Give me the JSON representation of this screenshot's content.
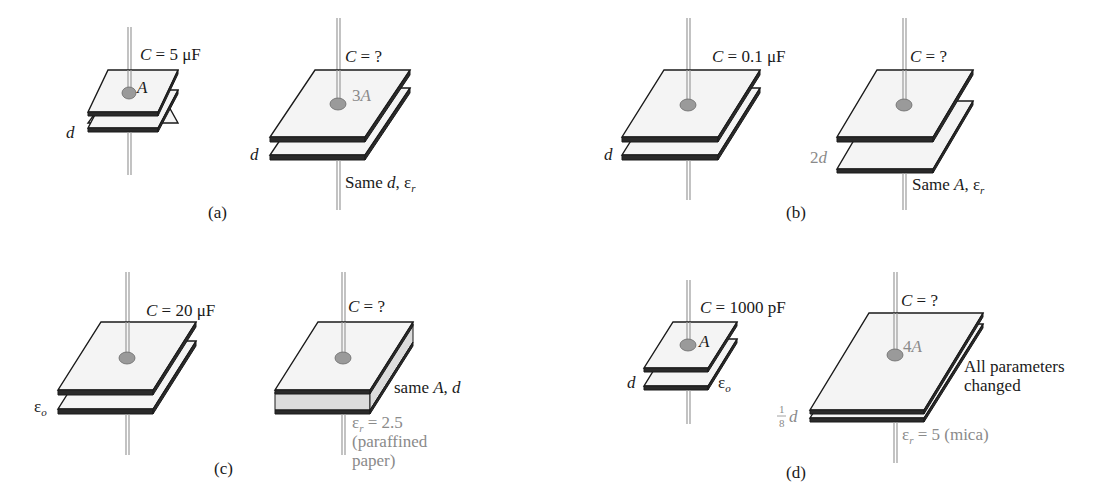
{
  "figure": {
    "panels": [
      {
        "id": "a",
        "caption": "(a)",
        "left": {
          "capacitance": "C = 5 μF",
          "C": "C",
          "eq": " = 5 ",
          "unit": "μF",
          "area_label": "A",
          "sep_label": "d"
        },
        "right": {
          "capacitance": "C = ?",
          "C": "C",
          "eq": " = ?",
          "area_label": "3A",
          "area_num": "3",
          "area_sym": "A",
          "sep_label": "d",
          "note": "Same d, ε_r",
          "note_pre": "Same ",
          "note_d": "d",
          "note_comma": ", ",
          "note_eps": "ε",
          "note_sub": "r"
        }
      },
      {
        "id": "b",
        "caption": "(b)",
        "left": {
          "capacitance": "C = 0.1 μF",
          "C": "C",
          "eq": " = 0.1 ",
          "unit": "μF",
          "sep_label": "d"
        },
        "right": {
          "capacitance": "C = ?",
          "C": "C",
          "eq": " = ?",
          "sep_label": "2d",
          "sep_num": "2",
          "sep_sym": "d",
          "note": "Same A, ε_r",
          "note_pre": "Same ",
          "note_A": "A",
          "note_comma": ", ",
          "note_eps": "ε",
          "note_sub": "r"
        }
      },
      {
        "id": "c",
        "caption": "(c)",
        "left": {
          "capacitance": "C = 20 μF",
          "C": "C",
          "eq": " = 20 ",
          "unit": "μF",
          "dielectric_label": "ε_o",
          "eps": "ε",
          "eps_sub": "o"
        },
        "right": {
          "capacitance": "C = ?",
          "C": "C",
          "eq": " = ?",
          "note": "same A, d",
          "note_pre": "same ",
          "note_A": "A",
          "note_comma": ", ",
          "note_d": "d",
          "dielectric_eps": "ε",
          "dielectric_sub": "r",
          "dielectric_val": " = 2.5",
          "material_line1": "(paraffined",
          "material_line2": "paper)"
        }
      },
      {
        "id": "d",
        "caption": "(d)",
        "left": {
          "capacitance": "C = 1000 pF",
          "C": "C",
          "eq": " = 1000 pF",
          "area_label": "A",
          "sep_label": "d",
          "eps": "ε",
          "eps_sub": "o"
        },
        "right": {
          "capacitance": "C = ?",
          "C": "C",
          "eq": " = ?",
          "area_num": "4",
          "area_sym": "A",
          "frac_num": "1",
          "frac_den": "8",
          "sep_sym": "d",
          "note_line1": "All parameters",
          "note_line2": "changed",
          "dielectric_eps": "ε",
          "dielectric_sub": "r",
          "dielectric_val": " = 5 (mica)"
        }
      }
    ]
  },
  "colors": {
    "ink": "#1a1a1a",
    "gray_label": "#8a8a8a",
    "plate_fill": "#f4f4f4",
    "dielectric_fill": "#dcdcdc"
  }
}
